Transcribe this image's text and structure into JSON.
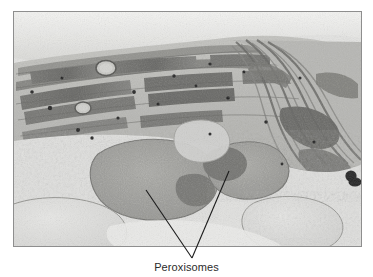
{
  "figure": {
    "type": "transmission-electron-micrograph",
    "caption": "Peroxisomes",
    "frame": {
      "x": 13,
      "y": 11,
      "width": 349,
      "height": 236,
      "border_color": "#8e8e8e"
    },
    "background_color": "#ffffff"
  },
  "micrograph": {
    "palette": {
      "cytoplasm_light": "#e8e8e6",
      "stroma_mid": "#b9b9b5",
      "grana_dark": "#6f6f6c",
      "membrane_darkest": "#4a4a48",
      "peroxisome_body": "#9a9a96",
      "peroxisome_core": "#6a6a66",
      "vacuole_pale": "#dcdcda",
      "black_granule": "#121212",
      "top_highlight": "#f2f2f0"
    },
    "features": [
      {
        "name": "grana-stack-upper-left",
        "label": "stacked thylakoid membranes"
      },
      {
        "name": "grana-fan-right",
        "label": "curved membrane fan"
      },
      {
        "name": "plastoglobule-1",
        "label": "small circular vesicle"
      },
      {
        "name": "plastoglobule-2",
        "label": "small circular vesicle"
      },
      {
        "name": "peroxisome-left",
        "label": "large peroxisome with crystalline core"
      },
      {
        "name": "peroxisome-right",
        "label": "peroxisome with dense core"
      },
      {
        "name": "vacuole-lower-left",
        "label": "pale vacuole"
      },
      {
        "name": "vacuole-lower-right",
        "label": "pale vacuole"
      },
      {
        "name": "dense-granule-right-edge",
        "label": "opaque black granule"
      }
    ]
  },
  "leaders": {
    "stroke_color": "#1c1c1c",
    "stroke_width": 1,
    "vertex": {
      "x": 192,
      "y": 258
    },
    "left_target": {
      "x": 146,
      "y": 190
    },
    "right_target": {
      "x": 229,
      "y": 171
    }
  }
}
